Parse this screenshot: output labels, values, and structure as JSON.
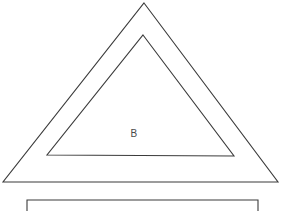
{
  "figure": {
    "background_color": "#ffffff",
    "stroke_color": "#3b3b3b",
    "label_color": "#4a4a4a",
    "width": 283,
    "height": 211
  },
  "shapes": {
    "outer_triangle": {
      "name": "outer-triangle",
      "points": "144,3 278,182 3,182",
      "apex": {
        "x": 144,
        "y": 3
      },
      "bottom_left": {
        "x": 3,
        "y": 182
      },
      "bottom_right": {
        "x": 278,
        "y": 182
      }
    },
    "inner_triangle": {
      "name": "inner-triangle",
      "points": "143,35 234,156 47,155",
      "apex": {
        "x": 143,
        "y": 35
      },
      "bottom_left": {
        "x": 47,
        "y": 155
      },
      "bottom_right": {
        "x": 234,
        "y": 156
      }
    },
    "bottom_rectangle": {
      "name": "bottom-rectangle",
      "points": "27,211 27,200 258,200 258,211",
      "left": 27,
      "right": 258,
      "top": 200,
      "clipped_at_bottom": true
    }
  },
  "labels": {
    "region_b": {
      "text": "B",
      "x": 134,
      "y": 134
    }
  }
}
